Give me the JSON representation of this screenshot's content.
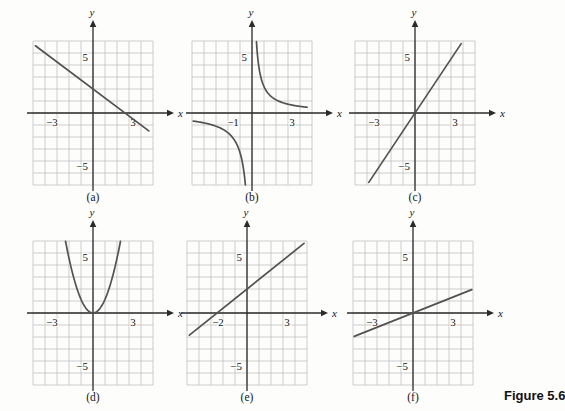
{
  "figure_label": "Figure 5.6",
  "colors": {
    "background": "#fdfdfc",
    "grid": "#bcbcbc",
    "axis": "#2b2b2b",
    "curve": "#525252",
    "text": "#161616"
  },
  "chart_data": {
    "type": "line",
    "panels": [
      {
        "id": "a",
        "caption": "(a)",
        "equation": "y ≈ -0.75x + 2 (decreasing line, y-intercept 2, x-intercept ≈ 2.7)",
        "xlabel": "x",
        "ylabel": "y",
        "xlim": [
          -5,
          5
        ],
        "ylim": [
          -6,
          6
        ],
        "grid": true,
        "x_ticks": [
          {
            "value": -3,
            "label": "−3",
            "dx": -5
          },
          {
            "value": 3,
            "label": "3",
            "dx": 4
          }
        ],
        "y_ticks": [
          {
            "value": 5,
            "label": "5"
          },
          {
            "value": -5,
            "label": "−5"
          }
        ],
        "curves": [
          {
            "kind": "segment",
            "from": [
              -4.8,
              5.6
            ],
            "to": [
              4.65,
              -1.49
            ]
          }
        ]
      },
      {
        "id": "b",
        "caption": "(b)",
        "equation": "y ≈ 2/x (reciprocal curve, branches in quadrants I and III, asymptotes on axes)",
        "xlabel": "x",
        "ylabel": "y",
        "xlim": [
          -5,
          5
        ],
        "ylim": [
          -6,
          6
        ],
        "grid": true,
        "x_ticks": [
          {
            "value": -1,
            "label": "−1",
            "dx": -7
          },
          {
            "value": 3,
            "label": "3",
            "dx": 4
          }
        ],
        "y_ticks": [
          {
            "value": 5,
            "label": "5"
          }
        ],
        "curves": [
          {
            "kind": "reciprocal",
            "k": 2.2,
            "x_range": [
              0.37,
              4.6
            ]
          },
          {
            "kind": "reciprocal",
            "k": 3.3,
            "x_range": [
              -4.9,
              -0.55
            ]
          }
        ]
      },
      {
        "id": "c",
        "caption": "(c)",
        "equation": "y ≈ 1.5x (increasing line through the origin)",
        "xlabel": "x",
        "ylabel": "y",
        "xlim": [
          -5,
          5
        ],
        "ylim": [
          -6,
          6
        ],
        "grid": true,
        "x_ticks": [
          {
            "value": -3,
            "label": "−3",
            "dx": -5
          },
          {
            "value": 3,
            "label": "3",
            "dx": 4
          }
        ],
        "y_ticks": [
          {
            "value": 5,
            "label": "5"
          },
          {
            "value": -5,
            "label": "−5"
          }
        ],
        "curves": [
          {
            "kind": "segment",
            "from": [
              -3.85,
              -5.78
            ],
            "to": [
              3.85,
              5.78
            ]
          }
        ]
      },
      {
        "id": "d",
        "caption": "(d)",
        "equation": "y ≈ x² (upward parabola, vertex at the origin)",
        "xlabel": "x",
        "ylabel": "y",
        "xlim": [
          -5,
          5
        ],
        "ylim": [
          -6,
          6
        ],
        "grid": true,
        "x_ticks": [
          {
            "value": -3,
            "label": "−3",
            "dx": -5
          },
          {
            "value": 3,
            "label": "3",
            "dx": 4
          }
        ],
        "y_ticks": [
          {
            "value": 5,
            "label": "5"
          },
          {
            "value": -5,
            "label": "−5"
          }
        ],
        "curves": [
          {
            "kind": "parabola",
            "a": 1.14,
            "x_range": [
              -2.29,
              2.29
            ]
          }
        ]
      },
      {
        "id": "e",
        "caption": "(e)",
        "equation": "y ≈ 0.8x + 2 (increasing line, x-intercept ≈ -2.3)",
        "xlabel": "x",
        "ylabel": "y",
        "xlim": [
          -5,
          5
        ],
        "ylim": [
          -6,
          6
        ],
        "grid": true,
        "x_ticks": [
          {
            "value": -2,
            "label": "−2",
            "dx": -5
          },
          {
            "value": 3,
            "label": "3",
            "dx": 4
          }
        ],
        "y_ticks": [
          {
            "value": 5,
            "label": "5"
          },
          {
            "value": -5,
            "label": "−5"
          }
        ],
        "curves": [
          {
            "kind": "segment",
            "from": [
              -4.8,
              -1.85
            ],
            "to": [
              4.75,
              5.8
            ]
          }
        ]
      },
      {
        "id": "f",
        "caption": "(f)",
        "equation": "y ≈ 0.4x (gently increasing line through the origin)",
        "xlabel": "x",
        "ylabel": "y",
        "xlim": [
          -5,
          5
        ],
        "ylim": [
          -6,
          6
        ],
        "grid": true,
        "x_ticks": [
          {
            "value": -3,
            "label": "−3",
            "dx": -5
          },
          {
            "value": 3,
            "label": "3",
            "dx": 4
          }
        ],
        "y_ticks": [
          {
            "value": 5,
            "label": "5"
          },
          {
            "value": -5,
            "label": "−5"
          }
        ],
        "curves": [
          {
            "kind": "segment",
            "from": [
              -4.9,
              -1.95
            ],
            "to": [
              4.9,
              1.95
            ]
          }
        ]
      }
    ]
  }
}
